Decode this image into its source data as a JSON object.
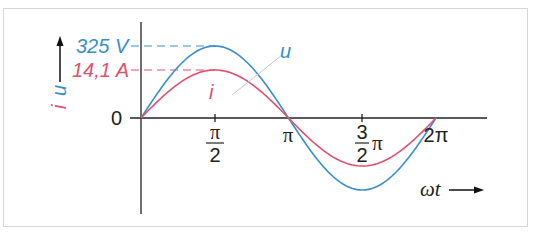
{
  "diagram": {
    "y_axis": {
      "labels": [
        "i",
        "u"
      ],
      "zero_label": "0",
      "ticks": [
        {
          "label": "325 V",
          "series": "u",
          "value": 325
        },
        {
          "label": "14,1 A",
          "series": "i",
          "value": 14.1
        }
      ]
    },
    "x_axis": {
      "label": "ωt",
      "ticks": [
        {
          "num": "π",
          "den": "2",
          "label": "π/2"
        },
        {
          "label": "π"
        },
        {
          "num": "3",
          "den": "2",
          "suffix": "π",
          "label": "3/2 π"
        },
        {
          "label": "2π"
        }
      ]
    },
    "curves": [
      {
        "name": "u",
        "label": "u",
        "color": "#3a8fc8",
        "amplitude": 325,
        "unit": "V"
      },
      {
        "name": "i",
        "label": "i",
        "color": "#e0506e",
        "amplitude": 14.1,
        "unit": "A"
      }
    ],
    "colors": {
      "voltage": "#3a8fc8",
      "current": "#e0506e",
      "axis": "#222222",
      "frame": "#d6d6d6"
    }
  },
  "chart_data": {
    "type": "line",
    "title": "",
    "xlabel": "ωt",
    "ylabel": "u, i",
    "x": [
      "0",
      "π/2",
      "π",
      "3/2 π",
      "2π"
    ],
    "series": [
      {
        "name": "u",
        "values": [
          0,
          325,
          0,
          -325,
          0
        ],
        "unit": "V"
      },
      {
        "name": "i",
        "values": [
          0,
          14.1,
          0,
          -14.1,
          0
        ],
        "unit": "A"
      }
    ],
    "annotations": [
      "325 V",
      "14,1 A"
    ],
    "grid": false
  }
}
